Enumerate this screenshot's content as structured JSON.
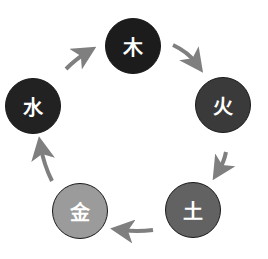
{
  "diagram": {
    "title": "",
    "type": "cycle",
    "nodes": [
      {
        "id": "wood",
        "label": "木",
        "cx": 133,
        "cy": 46,
        "fill": "#1c1c1c"
      },
      {
        "id": "fire",
        "label": "火",
        "cx": 223,
        "cy": 105,
        "fill": "#3a3a3a"
      },
      {
        "id": "earth",
        "label": "土",
        "cx": 193,
        "cy": 210,
        "fill": "#626262"
      },
      {
        "id": "metal",
        "label": "金",
        "cx": 80,
        "cy": 211,
        "fill": "#9b9b9b"
      },
      {
        "id": "water",
        "label": "水",
        "cx": 33,
        "cy": 106,
        "fill": "#222222"
      }
    ],
    "edges": [
      {
        "from": "木",
        "to": "火"
      },
      {
        "from": "火",
        "to": "土"
      },
      {
        "from": "土",
        "to": "金"
      },
      {
        "from": "金",
        "to": "水"
      },
      {
        "from": "水",
        "to": "木"
      }
    ],
    "arrow_color": "#7f7f7f"
  }
}
